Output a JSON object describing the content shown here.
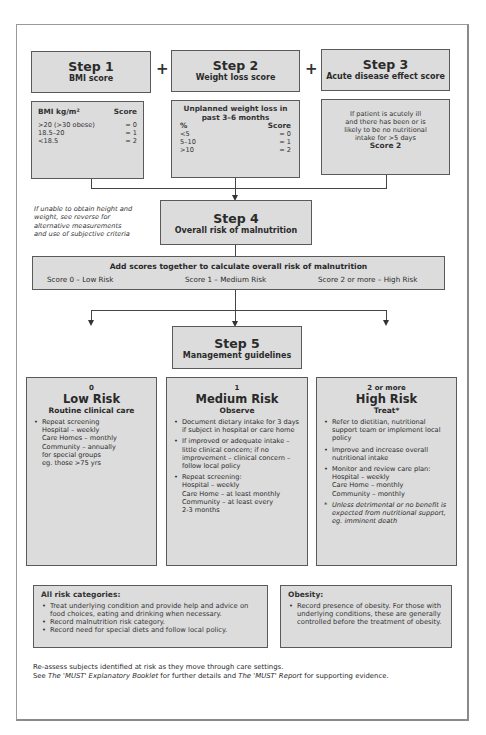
{
  "steps": [
    {
      "title": "Step 1",
      "subtitle": "BMI score"
    },
    {
      "title": "Step 2",
      "subtitle": "Weight loss score"
    },
    {
      "title": "Step 3",
      "subtitle": "Acute disease effect score"
    },
    {
      "title": "Step 4",
      "subtitle": "Overall risk of malnutrition"
    },
    {
      "title": "Step 5",
      "subtitle": "Management guidelines"
    }
  ],
  "plus_sign": "+",
  "bmi_table": {
    "header_left": "BMI kg/m²",
    "header_right": "Score",
    "rows": [
      {
        "range": ">20 (>30 obese)",
        "score": "= 0"
      },
      {
        "range": "18.5–20",
        "score": "= 1"
      },
      {
        "range": "<18.5",
        "score": "= 2"
      }
    ]
  },
  "weight_loss_table": {
    "heading_line1": "Unplanned weight loss in",
    "heading_line2": "past 3–6 months",
    "header_left": "%",
    "header_right": "Score",
    "rows": [
      {
        "range": "<5",
        "score": "= 0"
      },
      {
        "range": "5–10",
        "score": "= 1"
      },
      {
        "range": ">10",
        "score": "= 2"
      }
    ]
  },
  "acute_disease": {
    "line1": "If patient is acutely ill",
    "line2": "and there has been or is",
    "line3": "likely to be no nutritional",
    "line4": "intake for >5 days",
    "score": "Score 2"
  },
  "side_note": {
    "line1": "If unable to obtain height and",
    "line2": "weight, see reverse for",
    "line3": "alternative measurements",
    "line4": "and use of subjective criteria"
  },
  "overall_risk": {
    "heading": "Add scores together to calculate overall risk of malnutrition",
    "low": "Score 0 – Low Risk",
    "medium": "Score 1 – Medium Risk",
    "high": "Score 2 or more – High Risk"
  },
  "risk_boxes": {
    "low": {
      "score": "0",
      "title": "Low Risk",
      "subtitle": "Routine clinical care",
      "bullet1": "Repeat screening",
      "lines": [
        "Hospital – weekly",
        "Care Homes – monthly",
        "Community – annually",
        "for special groups",
        "eg. those >75 yrs"
      ]
    },
    "medium": {
      "score": "1",
      "title": "Medium Risk",
      "subtitle": "Observe",
      "bullet1": "Document dietary intake for 3 days if subject in hospital or care home",
      "bullet2": "If improved or adequate intake – little clinical concern; if no improvement – clinical concern – follow local policy",
      "bullet3": "Repeat screening:",
      "lines": [
        "Hospital – weekly",
        "Care Home – at least monthly",
        "Community – at least every",
        "2-3 months"
      ]
    },
    "high": {
      "score": "2 or more",
      "title": "High Risk",
      "subtitle": "Treat*",
      "bullet1": "Refer to dietitian, nutritional support team or implement local policy",
      "bullet2": "Improve and increase overall nutritional intake",
      "bullet3": "Monitor and review care plan:",
      "lines": [
        "Hospital – weekly",
        "Care Home – monthly",
        "Community – monthly"
      ],
      "footnote": "Unless detrimental or no benefit is expected from nutritional support, eg. imminent death"
    }
  },
  "all_risk": {
    "title": "All risk categories:",
    "items": [
      "Treat underlying condition and provide help and advice on food choices, eating and drinking when necessary.",
      "Record malnutrition risk category.",
      "Record need for special diets and follow local policy."
    ]
  },
  "obesity": {
    "title": "Obesity:",
    "item": "Record presence of obesity. For those with underlying conditions, these are generally controlled before the treatment of obesity."
  },
  "footer": {
    "line1": "Re-assess subjects identified at risk as they move through care settings.",
    "see": "See ",
    "booklet": "The 'MUST' Explanatory Booklet",
    "mid": " for further details and ",
    "report": "The 'MUST' Report",
    "end": " for supporting evidence."
  }
}
